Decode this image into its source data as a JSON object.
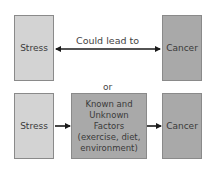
{
  "diagram": {
    "top_row": {
      "left_box": "Stress",
      "right_box": "Cancer",
      "connector_label": "Could lead to",
      "connector_type": "bidirectional-arrow"
    },
    "separator": "or",
    "bottom_row": {
      "left_box": "Stress",
      "middle_box": "Known and Unknown Factors (exercise, diet, environment)",
      "right_box": "Cancer",
      "connector_type": "unidirectional-arrow"
    },
    "colors": {
      "stress_box": "#d3d3d3",
      "cancer_box": "#a9a9a9",
      "factors_box": "#a9a9a9",
      "arrow": "#1a1a1a"
    }
  }
}
